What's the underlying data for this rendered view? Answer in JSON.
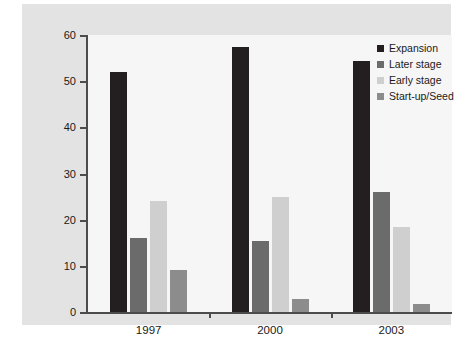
{
  "chart_data": {
    "type": "bar",
    "title": "",
    "subtitle": "",
    "xlabel": "",
    "ylabel": "",
    "categories": [
      "1997",
      "2000",
      "2003"
    ],
    "series": [
      {
        "name": "Expansion",
        "color": "#231f20",
        "values": [
          52,
          57.5,
          54.3
        ]
      },
      {
        "name": "Later stage",
        "color": "#6b6b6b",
        "values": [
          16,
          15.4,
          25.9
        ]
      },
      {
        "name": "Early stage",
        "color": "#cfcfcf",
        "values": [
          24,
          24.9,
          18.5
        ]
      },
      {
        "name": "Start-up/Seed",
        "color": "#8c8c8c",
        "values": [
          9,
          2.8,
          1.8
        ]
      }
    ],
    "yticks": [
      0,
      10,
      20,
      30,
      40,
      50,
      60
    ],
    "ytick_labels": [
      "0",
      "10",
      "20",
      "30",
      "40",
      "50",
      "60"
    ],
    "ylim": [
      0,
      60
    ],
    "grid": false,
    "legend_position": "top-right",
    "annotations": []
  },
  "legend": {
    "items": [
      {
        "label": "Expansion"
      },
      {
        "label": "Later stage"
      },
      {
        "label": "Early stage"
      },
      {
        "label": "Start-up/Seed"
      }
    ]
  },
  "edge_text": ""
}
